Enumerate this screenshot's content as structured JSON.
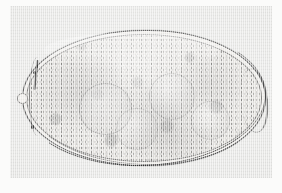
{
  "image": {
    "kind": "photomicrograph",
    "subject": "trematode-egg",
    "caption": "",
    "width_px": 282,
    "height_px": 193
  },
  "plate": {
    "paper_color": "#fbfbfa",
    "field_color": "#e7e7e5",
    "field_left_px": 10,
    "field_top_px": 6,
    "field_width_px": 262,
    "field_height_px": 172
  },
  "specimen": {
    "label": "operculate fluke egg",
    "shell_color": "#4d4d4d",
    "interior_color": "#e4e2de",
    "center_x_px": 134,
    "center_y_px": 92,
    "width_px": 244,
    "height_px": 136,
    "orientation": "horizontal-ellipse",
    "features": [
      {
        "name": "egg-shell-outer-contour",
        "note": "thin dark line encircling the egg"
      },
      {
        "name": "egg-shell-inner-contour",
        "note": "faint second line inside the outer contour"
      },
      {
        "name": "shell-thickening-ventral",
        "note": "heavier dark rim along the lower margin"
      },
      {
        "name": "shell-thickening-right-pole",
        "note": "dense shell material at the right pole"
      },
      {
        "name": "operculum",
        "note": "flattened left pole bearing a small knob"
      },
      {
        "name": "operculum-knob",
        "note": "small round protrusion at the left pole"
      },
      {
        "name": "shell-pigment-spots",
        "note": "two dark granules adhering to the left shell"
      },
      {
        "name": "vitelline-mass",
        "note": "pale granular yolk filling the egg"
      },
      {
        "name": "germ-cells",
        "note": "four rounded cell outlines within the yolk"
      }
    ]
  }
}
